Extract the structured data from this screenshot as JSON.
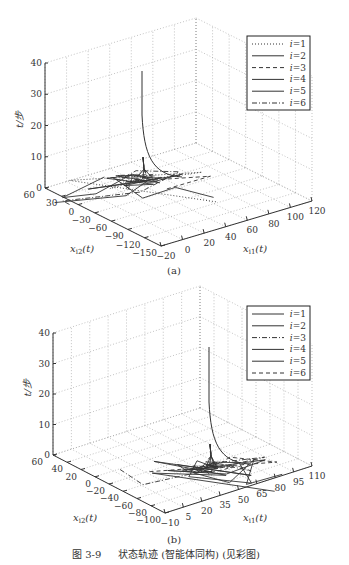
{
  "figure": {
    "caption_number": "图 3-9",
    "caption_text": "状态轨迹 (智能体同构) (见彩图)"
  },
  "chart_data": [
    {
      "type": "line",
      "subtype": "3d-trajectory",
      "panel_label": "(a)",
      "title": "",
      "xlabel": "x_i1(t)",
      "ylabel": "x_i2(t)",
      "zlabel": "t/步",
      "x_ticks": [
        "-20",
        "0",
        "20",
        "40",
        "60",
        "80",
        "100",
        "120"
      ],
      "y_ticks": [
        "60",
        "30",
        "0",
        "-30",
        "-60",
        "-90",
        "-120",
        "-150"
      ],
      "z_ticks": [
        "0",
        "10",
        "20",
        "30",
        "40"
      ],
      "xlim": [
        -20,
        120
      ],
      "ylim": [
        -150,
        60
      ],
      "zlim": [
        0,
        40
      ],
      "grid": true,
      "legend_position": "upper right",
      "series": [
        {
          "name": "i=1",
          "style": "dotted"
        },
        {
          "name": "i=2",
          "style": "solid"
        },
        {
          "name": "i=3",
          "style": "dashed"
        },
        {
          "name": "i=4",
          "style": "solid"
        },
        {
          "name": "i=5",
          "style": "solid"
        },
        {
          "name": "i=6",
          "style": "dashdot"
        }
      ],
      "notes": "All agents' trajectories oscillate near t=0 and converge; converged trajectory rises vertically to about t=37 at x_i1≈40, x_i2≈10."
    },
    {
      "type": "line",
      "subtype": "3d-trajectory",
      "panel_label": "(b)",
      "title": "",
      "xlabel": "x_i1(t)",
      "ylabel": "x_i2(t)",
      "zlabel": "t/步",
      "x_ticks": [
        "-10",
        "5",
        "20",
        "35",
        "50",
        "65",
        "80",
        "95",
        "110"
      ],
      "y_ticks": [
        "60",
        "40",
        "20",
        "0",
        "-20",
        "-40",
        "-60",
        "-80",
        "-100"
      ],
      "z_ticks": [
        "0",
        "10",
        "20",
        "30",
        "40"
      ],
      "xlim": [
        -10,
        110
      ],
      "ylim": [
        -100,
        60
      ],
      "zlim": [
        0,
        40
      ],
      "grid": true,
      "legend_position": "upper right",
      "series": [
        {
          "name": "i=1",
          "style": "solid"
        },
        {
          "name": "i=2",
          "style": "solid"
        },
        {
          "name": "i=3",
          "style": "dashdot"
        },
        {
          "name": "i=4",
          "style": "solid"
        },
        {
          "name": "i=5",
          "style": "solid"
        },
        {
          "name": "i=6",
          "style": "dashed"
        }
      ],
      "notes": "Trajectories oscillate near t=0 then converge; converged trajectory rises vertically to about t=35 at x_i1≈65, x_i2≈20."
    }
  ]
}
